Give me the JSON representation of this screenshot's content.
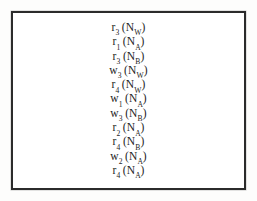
{
  "figure": {
    "kind": "operation-trace-listing",
    "border_color": "#2b2b2b",
    "page_background": "#fdfdfc",
    "frame_background": "#ffffff",
    "text_color": "#1d1d1d",
    "lines": [
      {
        "op": "r",
        "op_index": "3",
        "item": "N",
        "item_sub": "W",
        "text": "r3 (NW)"
      },
      {
        "op": "r",
        "op_index": "1",
        "item": "N",
        "item_sub": "A",
        "text": "r1 (NA)"
      },
      {
        "op": "r",
        "op_index": "3",
        "item": "N",
        "item_sub": "B",
        "text": "r3 (NB)"
      },
      {
        "op": "w",
        "op_index": "3",
        "item": "N",
        "item_sub": "W",
        "text": "w3 (NW)"
      },
      {
        "op": "r",
        "op_index": "4",
        "item": "N",
        "item_sub": "W",
        "text": "r4 (NW)"
      },
      {
        "op": "w",
        "op_index": "1",
        "item": "N",
        "item_sub": "A",
        "text": "w1 (NA)"
      },
      {
        "op": "w",
        "op_index": "3",
        "item": "N",
        "item_sub": "B",
        "text": "w3 (NB)"
      },
      {
        "op": "r",
        "op_index": "2",
        "item": "N",
        "item_sub": "A",
        "text": "r2 (NA)"
      },
      {
        "op": "r",
        "op_index": "4",
        "item": "N",
        "item_sub": "B",
        "text": "r4 (NB)"
      },
      {
        "op": "w",
        "op_index": "2",
        "item": "N",
        "item_sub": "A",
        "text": "w2 (NA)"
      },
      {
        "op": "r",
        "op_index": "4",
        "item": "N",
        "item_sub": "A",
        "text": "r4 (NA)"
      }
    ]
  }
}
